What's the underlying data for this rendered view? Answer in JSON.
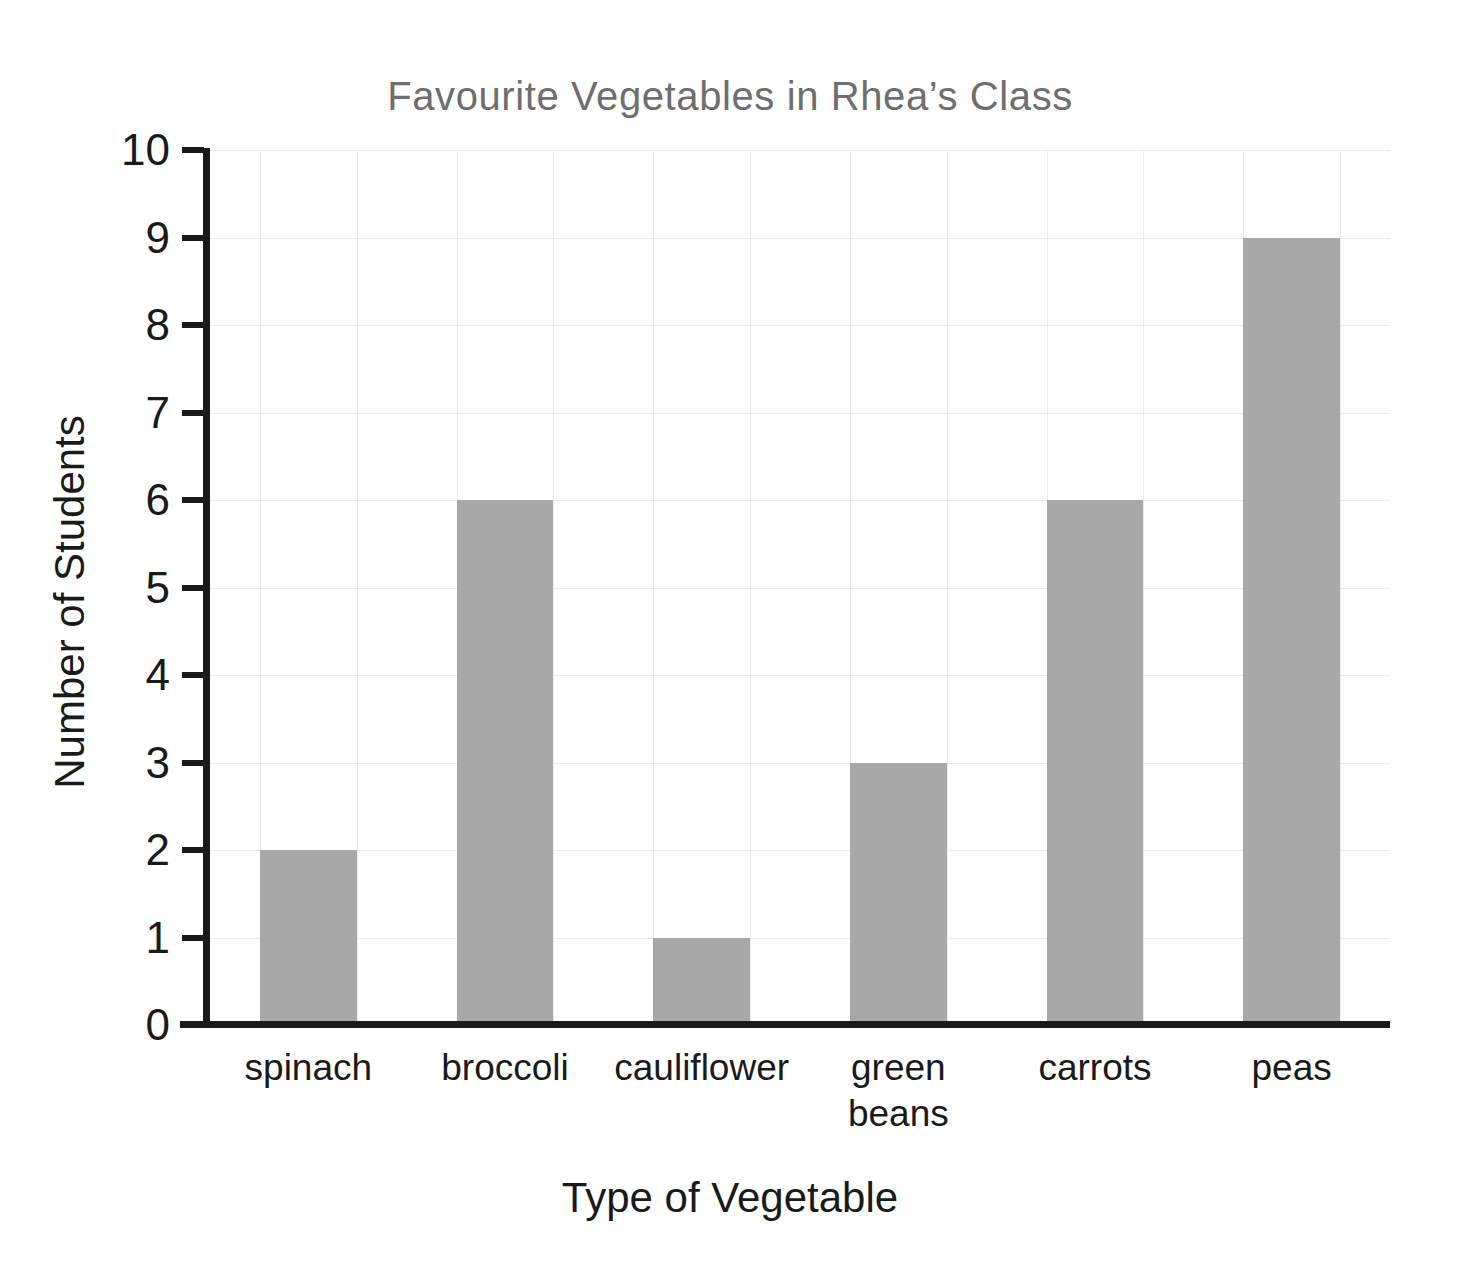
{
  "chart_data": {
    "type": "bar",
    "title": "Favourite Vegetables in Rhea’s Class",
    "xlabel": "Type of Vegetable",
    "ylabel": "Number of Students",
    "categories": [
      "spinach",
      "broccoli",
      "cauliflower",
      "green beans",
      "carrots",
      "peas"
    ],
    "values": [
      2,
      6,
      1,
      3,
      6,
      9
    ],
    "ylim": [
      0,
      10
    ],
    "ytick_labels": [
      "0",
      "1",
      "2",
      "3",
      "4",
      "5",
      "6",
      "7",
      "8",
      "9",
      "10"
    ],
    "ytick_values": [
      0,
      1,
      2,
      3,
      4,
      5,
      6,
      7,
      8,
      9,
      10
    ],
    "grid": true,
    "legend": "none",
    "bar_color": "#a8a8a8",
    "title_color": "#6e6e6e",
    "axis_color": "#1a1a1a",
    "grid_color": "#ececec",
    "background_color": "#ffffff"
  }
}
